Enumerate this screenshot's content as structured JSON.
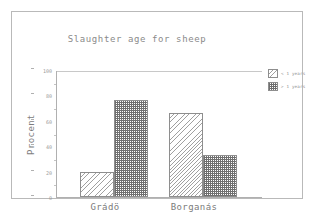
{
  "chart_data": {
    "type": "bar",
    "title": "Slaughter age for sheep",
    "xlabel": "",
    "ylabel": "Procent",
    "categories": [
      "Grádö",
      "Borganás"
    ],
    "series": [
      {
        "name": "< 1 years",
        "values": [
          20,
          67
        ],
        "pattern": "diagonal-hatch-light"
      },
      {
        "name": "> 1 years",
        "values": [
          77,
          33
        ],
        "pattern": "checkerboard-dark"
      }
    ],
    "ylim": [
      0,
      100
    ],
    "yticks": [
      0,
      20,
      40,
      60,
      80,
      100
    ],
    "ytick_labels": [
      "0",
      "20",
      "40",
      "60",
      "80",
      "100"
    ],
    "grid": false,
    "legend_position": "right",
    "colors": {
      "frame": "#b9b9b9",
      "axis": "#b0b0b0",
      "title_text": "#8a8a8a",
      "tick_text": "#9a9a9a",
      "label_text": "#7b7b7b",
      "bar_outline": "#8e8e8e",
      "background": "#ffffff"
    }
  },
  "legend": {
    "items": [
      {
        "label": "< 1 years"
      },
      {
        "label": "> 1 years"
      }
    ]
  }
}
